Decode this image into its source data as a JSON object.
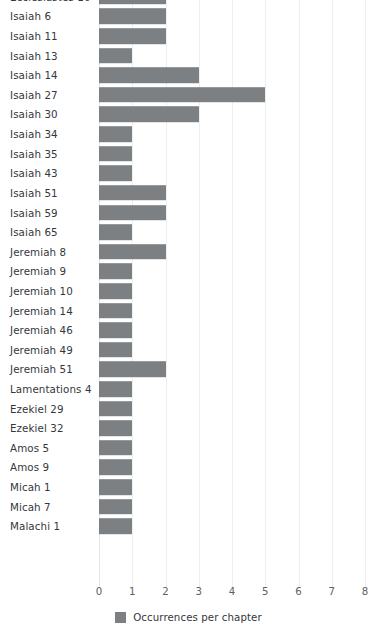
{
  "chart_data": {
    "type": "bar",
    "orientation": "horizontal",
    "title": "",
    "subtitle": "",
    "xlabel": "",
    "ylabel": "",
    "xlim": [
      0,
      8
    ],
    "xticks": [
      0,
      1,
      2,
      3,
      4,
      5,
      6,
      7,
      8
    ],
    "xtick_labels": [
      "0",
      "1",
      "2",
      "3",
      "4",
      "5",
      "6",
      "7",
      "8"
    ],
    "grid": true,
    "legend_position": "bottom",
    "series": [
      {
        "name": "Occurrences per chapter",
        "color": "#7d8083",
        "values": [
          2,
          2,
          2,
          1,
          3,
          5,
          3,
          1,
          1,
          1,
          2,
          2,
          1,
          2,
          1,
          1,
          1,
          1,
          1,
          2,
          1,
          1,
          1,
          1,
          1,
          1,
          1,
          1
        ]
      }
    ],
    "categories": [
      "Ecclesiastes 10",
      "Isaiah 6",
      "Isaiah 11",
      "Isaiah 13",
      "Isaiah 14",
      "Isaiah 27",
      "Isaiah 30",
      "Isaiah 34",
      "Isaiah 35",
      "Isaiah 43",
      "Isaiah 51",
      "Isaiah 59",
      "Isaiah 65",
      "Jeremiah 8",
      "Jeremiah 9",
      "Jeremiah 10",
      "Jeremiah 14",
      "Jeremiah 46",
      "Jeremiah 49",
      "Jeremiah 51",
      "Lamentations 4",
      "Ezekiel 29",
      "Ezekiel 32",
      "Amos 5",
      "Amos 9",
      "Micah 1",
      "Micah 7",
      "Malachi 1"
    ]
  },
  "legend": {
    "label": "Occurrences per chapter",
    "swatch_color": "#7d8083"
  },
  "colors": {
    "bar": "#7d8083",
    "gridline": "#eceef0",
    "text": "#33373c",
    "tick_text": "#5d6166",
    "background": "#ffffff"
  }
}
